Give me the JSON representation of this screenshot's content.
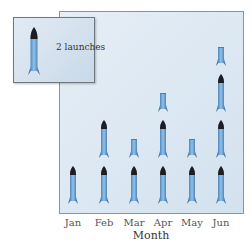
{
  "chart_data": {
    "type": "pictograph",
    "title": "",
    "xlabel": "Month",
    "ylabel": "",
    "categories": [
      "Jan",
      "Feb",
      "Mar",
      "Apr",
      "May",
      "Jun"
    ],
    "icons": [
      1,
      2,
      1.5,
      2.5,
      1.5,
      3.5
    ],
    "values": [
      2,
      4,
      3,
      5,
      3,
      7
    ],
    "legend": {
      "icon": "rocket-icon",
      "label": "2 launches",
      "value_per_icon": 2
    },
    "colors": {
      "rocket_body": "#5b9bd5",
      "rocket_nose": "#222222",
      "panel_bg": "#dbe6f1"
    }
  },
  "legend": {
    "label": "2 launches"
  },
  "axis": {
    "x_title": "Month",
    "ticks": [
      "Jan",
      "Feb",
      "Mar",
      "Apr",
      "May",
      "Jun"
    ]
  }
}
